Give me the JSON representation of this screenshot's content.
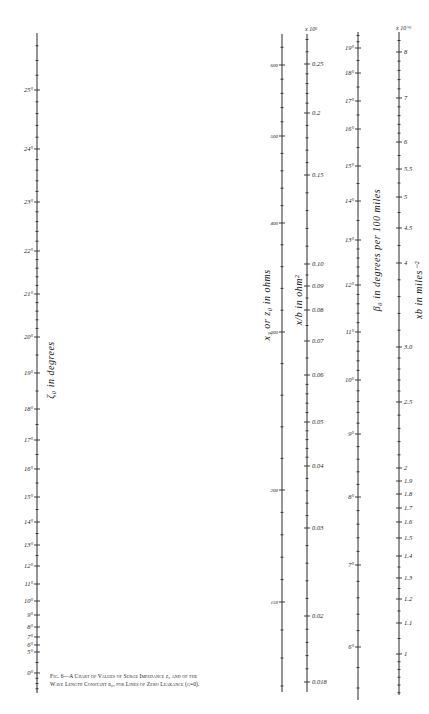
{
  "chart_data": {
    "type": "nomograph",
    "caption": {
      "fig": "Fig. 6—",
      "line1": "Fig. 6—A Chart of Values of Surge Impedance z₀ and of the",
      "line2": "Wave Length Constant β₀, for Lines of Zero Leakance (g=0)."
    },
    "scales": [
      {
        "id": "zeta0",
        "label": "ζ₀ in degrees",
        "x": 37,
        "y_top": 33,
        "y_bottom": 693,
        "ticks": [
          {
            "label": "25°",
            "y": 90
          },
          {
            "label": "24°",
            "y": 149
          },
          {
            "label": "23°",
            "y": 202
          },
          {
            "label": "22°",
            "y": 251
          },
          {
            "label": "21°",
            "y": 294
          },
          {
            "label": "20°",
            "y": 337
          },
          {
            "label": "19°",
            "y": 373
          },
          {
            "label": "18°",
            "y": 409
          },
          {
            "label": "17°",
            "y": 440
          },
          {
            "label": "16°",
            "y": 469
          },
          {
            "label": "15°",
            "y": 497
          },
          {
            "label": "14°",
            "y": 522
          },
          {
            "label": "13°",
            "y": 545
          },
          {
            "label": "12°",
            "y": 566
          },
          {
            "label": "11°",
            "y": 584
          },
          {
            "label": "10°",
            "y": 601
          },
          {
            "label": "9°",
            "y": 615
          },
          {
            "label": "8°",
            "y": 627
          },
          {
            "label": "7°",
            "y": 637
          },
          {
            "label": "6°",
            "y": 645
          },
          {
            "label": "5°",
            "y": 652
          },
          {
            "label": "0°",
            "y": 673
          }
        ],
        "label_side": "left"
      },
      {
        "id": "z0",
        "label": "x₃ or z₀ in ohms",
        "x": 282,
        "y_top": 34,
        "y_bottom": 692,
        "ticks": [
          {
            "label": "600",
            "y": 65
          },
          {
            "label": "500",
            "y": 136
          },
          {
            "label": "400",
            "y": 223
          },
          {
            "label": "300",
            "y": 332
          },
          {
            "label": "200",
            "y": 490
          },
          {
            "label": "150",
            "y": 602
          }
        ],
        "label_side": "left"
      },
      {
        "id": "x_over_b",
        "label": "x/b in ohm²",
        "multiplier": "x 10⁶",
        "x": 307,
        "y_top": 34,
        "y_bottom": 692,
        "ticks": [
          {
            "label": "0.25",
            "y": 64
          },
          {
            "label": "0.2",
            "y": 113
          },
          {
            "label": "0.15",
            "y": 175
          },
          {
            "label": "0.10",
            "y": 264
          },
          {
            "label": "0.09",
            "y": 286
          },
          {
            "label": "0.08",
            "y": 310
          },
          {
            "label": "0.07",
            "y": 341
          },
          {
            "label": "0.06",
            "y": 375
          },
          {
            "label": "0.05",
            "y": 422
          },
          {
            "label": "0.04",
            "y": 466
          },
          {
            "label": "0.03",
            "y": 528
          },
          {
            "label": "0.02",
            "y": 616
          },
          {
            "label": "0.018",
            "y": 682
          }
        ],
        "label_side": "right"
      },
      {
        "id": "beta0",
        "label": "β₀ in degrees per 100 miles",
        "x": 358,
        "y_top": 32,
        "y_bottom": 700,
        "ticks": [
          {
            "label": "19°",
            "y": 48
          },
          {
            "label": "18°",
            "y": 73
          },
          {
            "label": "17°",
            "y": 101
          },
          {
            "label": "16°",
            "y": 129
          },
          {
            "label": "15°",
            "y": 166
          },
          {
            "label": "14°",
            "y": 201
          },
          {
            "label": "13°",
            "y": 240
          },
          {
            "label": "12°",
            "y": 285
          },
          {
            "label": "11°",
            "y": 332
          },
          {
            "label": "10°",
            "y": 380
          },
          {
            "label": "9°",
            "y": 434
          },
          {
            "label": "8°",
            "y": 497
          },
          {
            "label": "7°",
            "y": 565
          },
          {
            "label": "6°",
            "y": 647
          }
        ],
        "label_side": "left"
      },
      {
        "id": "xb",
        "label": "xb in miles⁻²",
        "multiplier": "x 10⁻⁶",
        "x": 399,
        "y_top": 32,
        "y_bottom": 695,
        "ticks": [
          {
            "label": "8",
            "y": 52
          },
          {
            "label": "7",
            "y": 98
          },
          {
            "label": "6",
            "y": 142
          },
          {
            "label": "5.5",
            "y": 169
          },
          {
            "label": "5",
            "y": 197
          },
          {
            "label": "4.5",
            "y": 228
          },
          {
            "label": "4",
            "y": 263
          },
          {
            "label": "3.0",
            "y": 347
          },
          {
            "label": "2.5",
            "y": 402
          },
          {
            "label": "2",
            "y": 468
          },
          {
            "label": "1.9",
            "y": 481
          },
          {
            "label": "1.8",
            "y": 494
          },
          {
            "label": "1.7",
            "y": 508
          },
          {
            "label": "1.6",
            "y": 522
          },
          {
            "label": "1.5",
            "y": 538
          },
          {
            "label": "1.4",
            "y": 556
          },
          {
            "label": "1.3",
            "y": 578
          },
          {
            "label": "1.2",
            "y": 599
          },
          {
            "label": "1.1",
            "y": 623
          },
          {
            "label": "1",
            "y": 654
          }
        ],
        "label_side": "right"
      }
    ],
    "axis_titles": [
      {
        "text": "ζ₀ in degrees",
        "x": 54,
        "y": 370,
        "rotate": -90
      },
      {
        "text": "x₃ or z₀ in ohms",
        "x": 270,
        "y": 305,
        "rotate": -90
      },
      {
        "text": "x/b in ohm²",
        "x": 302,
        "y": 300,
        "rotate": -90
      },
      {
        "text": "β₀ in degrees per 100 miles",
        "x": 380,
        "y": 250,
        "rotate": -90
      },
      {
        "text": "xb in miles⁻²",
        "x": 422,
        "y": 290,
        "rotate": -90
      }
    ],
    "multipliers": [
      {
        "text": "x 10⁶",
        "x": 305,
        "y": 31
      },
      {
        "text": "x 10⁻⁶",
        "x": 396,
        "y": 30
      }
    ],
    "grid": false,
    "legend": null
  }
}
